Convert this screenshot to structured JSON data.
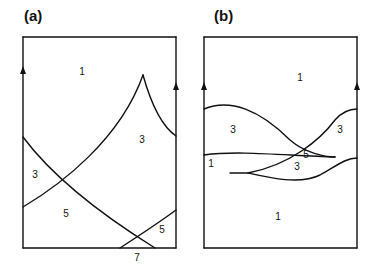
{
  "panels": [
    {
      "label": "(a)",
      "regions": [
        {
          "text": "1",
          "x": 82,
          "y": 71
        },
        {
          "text": "3",
          "x": 142,
          "y": 139
        },
        {
          "text": "3",
          "x": 35,
          "y": 174
        },
        {
          "text": "5",
          "x": 66,
          "y": 213
        },
        {
          "text": "5",
          "x": 162,
          "y": 229
        },
        {
          "text": "7",
          "x": 137,
          "y": 257
        }
      ]
    },
    {
      "label": "(b)",
      "regions": [
        {
          "text": "1",
          "x": 300,
          "y": 77
        },
        {
          "text": "3",
          "x": 233,
          "y": 129
        },
        {
          "text": "3",
          "x": 340,
          "y": 129
        },
        {
          "text": "1",
          "x": 211,
          "y": 163
        },
        {
          "text": "5",
          "x": 306,
          "y": 154
        },
        {
          "text": "3",
          "x": 297,
          "y": 166
        },
        {
          "text": "1",
          "x": 278,
          "y": 216
        }
      ]
    }
  ]
}
